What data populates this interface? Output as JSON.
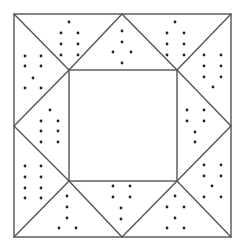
{
  "figure": {
    "kind": "quilt-block-pattern",
    "line_color": "#555555",
    "dot_color": "#222222",
    "background": "#ffffff",
    "outer_square": {
      "x1": 14,
      "y1": 14,
      "x2": 231,
      "y2": 237
    },
    "inner_square": {
      "x1": 69,
      "y1": 70,
      "x2": 177,
      "y2": 181
    },
    "lines": [
      [
        14,
        14,
        69,
        70
      ],
      [
        231,
        14,
        177,
        70
      ],
      [
        14,
        237,
        69,
        181
      ],
      [
        231,
        237,
        177,
        181
      ],
      [
        122,
        14,
        69,
        70
      ],
      [
        122,
        14,
        177,
        70
      ],
      [
        14,
        126,
        69,
        70
      ],
      [
        14,
        126,
        69,
        181
      ],
      [
        231,
        126,
        177,
        70
      ],
      [
        231,
        126,
        177,
        181
      ],
      [
        122,
        237,
        69,
        181
      ],
      [
        122,
        237,
        177,
        181
      ]
    ],
    "dots": [
      [
        69,
        22
      ],
      [
        61,
        33
      ],
      [
        78,
        33
      ],
      [
        61,
        44
      ],
      [
        78,
        44
      ],
      [
        61,
        55
      ],
      [
        78,
        55
      ],
      [
        122,
        31
      ],
      [
        122,
        42
      ],
      [
        113,
        52
      ],
      [
        131,
        52
      ],
      [
        122,
        63
      ],
      [
        175,
        22
      ],
      [
        167,
        33
      ],
      [
        184,
        33
      ],
      [
        167,
        44
      ],
      [
        184,
        44
      ],
      [
        167,
        55
      ],
      [
        184,
        55
      ],
      [
        25,
        56
      ],
      [
        41,
        56
      ],
      [
        25,
        66
      ],
      [
        41,
        66
      ],
      [
        33,
        78
      ],
      [
        25,
        88
      ],
      [
        41,
        88
      ],
      [
        50,
        110
      ],
      [
        41,
        121
      ],
      [
        58,
        121
      ],
      [
        41,
        131
      ],
      [
        58,
        131
      ],
      [
        41,
        142
      ],
      [
        58,
        142
      ],
      [
        25,
        166
      ],
      [
        41,
        166
      ],
      [
        25,
        177
      ],
      [
        41,
        177
      ],
      [
        25,
        188
      ],
      [
        41,
        188
      ],
      [
        25,
        198
      ],
      [
        41,
        198
      ],
      [
        204,
        55
      ],
      [
        221,
        55
      ],
      [
        204,
        66
      ],
      [
        221,
        66
      ],
      [
        204,
        77
      ],
      [
        221,
        77
      ],
      [
        213,
        87
      ],
      [
        187,
        110
      ],
      [
        204,
        110
      ],
      [
        187,
        121
      ],
      [
        204,
        121
      ],
      [
        195,
        132
      ],
      [
        195,
        142
      ],
      [
        204,
        165
      ],
      [
        221,
        165
      ],
      [
        204,
        176
      ],
      [
        221,
        176
      ],
      [
        212,
        186
      ],
      [
        204,
        197
      ],
      [
        221,
        197
      ],
      [
        67,
        196
      ],
      [
        67,
        207
      ],
      [
        67,
        218
      ],
      [
        59,
        228
      ],
      [
        76,
        228
      ],
      [
        113,
        186
      ],
      [
        130,
        186
      ],
      [
        113,
        197
      ],
      [
        130,
        197
      ],
      [
        121,
        208
      ],
      [
        121,
        219
      ],
      [
        175,
        196
      ],
      [
        167,
        207
      ],
      [
        184,
        207
      ],
      [
        175,
        218
      ],
      [
        167,
        228
      ],
      [
        184,
        228
      ]
    ]
  }
}
